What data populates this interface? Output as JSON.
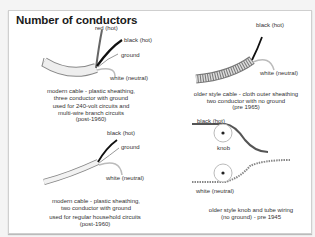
{
  "title": "Number of conductors",
  "panels": [
    {
      "id": "modern-3-conductor",
      "labels": [
        "red (hot)",
        "black (hot)",
        "ground",
        "white (neutral)"
      ],
      "caption": [
        "modern cable - plastic sheathing,",
        "three conductor with ground"
      ],
      "usage": [
        "used for 240-volt circuits and",
        "multi-wire branch circuits",
        "(post-1960)"
      ]
    },
    {
      "id": "older-cloth-2-conductor",
      "labels": [
        "black (hot)",
        "white (neutral)"
      ],
      "caption": [
        "older style cable - cloth outer sheathing",
        "two conductor with no ground",
        "(pre 1965)"
      ]
    },
    {
      "id": "modern-2-conductor",
      "labels": [
        "black (hot)",
        "ground",
        "white (neutral)"
      ],
      "caption": [
        "modern cable - plastic sheathing,",
        "two conductor with ground"
      ],
      "usage": [
        "used for regular household circuits",
        "(post-1960)"
      ]
    },
    {
      "id": "knob-and-tube",
      "labels": [
        "black (hot)",
        "knob",
        "white (neutral)"
      ],
      "caption": [
        "older style knob and tube wiring",
        "(no ground) - pre 1945"
      ]
    }
  ],
  "colors": {
    "frame_border": "#cfcfcf",
    "sheath": "#e8e8e8",
    "black_wire": "#111111",
    "red_wire": "#555555",
    "ground_wire": "#9a9a9a",
    "white_wire": "#dcdcdc"
  }
}
